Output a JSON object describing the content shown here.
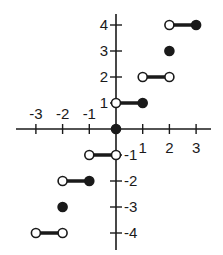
{
  "chart_data": {
    "type": "line",
    "title": "",
    "xlabel": "",
    "ylabel": "",
    "xlim": [
      -3.5,
      3.5
    ],
    "ylim": [
      -4.5,
      4.5
    ],
    "grid": false,
    "x_ticks": [
      -3,
      -2,
      -1,
      1,
      2,
      3
    ],
    "y_ticks": [
      4,
      3,
      2,
      1,
      -1,
      -2,
      -3,
      -4
    ],
    "x_tick_labels": [
      "-3",
      "-2",
      "-1",
      "1",
      "2",
      "3"
    ],
    "y_tick_labels": [
      "4",
      "3",
      "2",
      "1",
      "-1",
      "-2",
      "-3",
      "-4"
    ],
    "segments": [
      {
        "x0": 2,
        "x1": 3,
        "y": 4,
        "left": "open",
        "right": "closed"
      },
      {
        "x0": 1,
        "x1": 2,
        "y": 2,
        "left": "open",
        "right": "open"
      },
      {
        "x0": 0,
        "x1": 1,
        "y": 1,
        "left": "open",
        "right": "closed"
      },
      {
        "x0": -1,
        "x1": 0,
        "y": -1,
        "left": "open",
        "right": "open"
      },
      {
        "x0": -2,
        "x1": -1,
        "y": -2,
        "left": "open",
        "right": "closed"
      },
      {
        "x0": -3,
        "x1": -2,
        "y": -4,
        "left": "open",
        "right": "open"
      }
    ],
    "points": [
      {
        "x": 2,
        "y": 3,
        "style": "closed"
      },
      {
        "x": 0,
        "y": 0,
        "style": "closed"
      },
      {
        "x": -2,
        "y": -3,
        "style": "closed"
      }
    ]
  },
  "colors": {
    "ink": "#1a1a1a",
    "background": "#ffffff"
  }
}
